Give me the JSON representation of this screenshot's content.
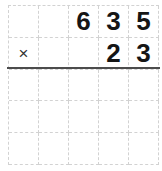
{
  "worksheet": {
    "operator": "×",
    "multiplicand": "635",
    "multiplier": "23",
    "grid": {
      "columns": 5,
      "rows": 5,
      "cells": [
        [
          "",
          "",
          "6",
          "3",
          "5"
        ],
        [
          "×",
          "",
          "",
          "2",
          "3"
        ],
        [
          "",
          "",
          "",
          "",
          ""
        ],
        [
          "",
          "",
          "",
          "",
          ""
        ],
        [
          "",
          "",
          "",
          "",
          ""
        ]
      ]
    },
    "colors": {
      "background": "#ffffff",
      "grid_line": "#d2d2d2",
      "rule_line": "#4c4c4c",
      "digit": "#151515"
    }
  }
}
